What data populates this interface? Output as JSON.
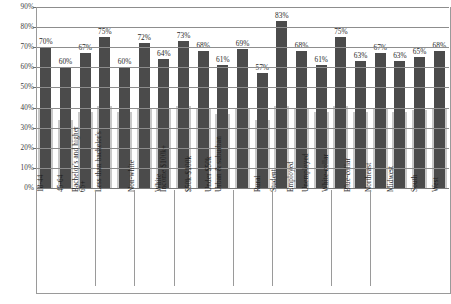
{
  "chart_data": {
    "type": "bar",
    "title": "",
    "xlabel": "",
    "ylabel": "",
    "ylim": [
      0,
      90
    ],
    "grid": true,
    "legend": "none",
    "ytick_labels": [
      "90%",
      "80%",
      "70%",
      "60%",
      "50%",
      "40%",
      "30%",
      "20%",
      "10%",
      "0%"
    ],
    "ytick_values": [
      90,
      80,
      70,
      60,
      50,
      40,
      30,
      20,
      10,
      0
    ],
    "categories": [
      "18-44",
      "45-64",
      "65+",
      "Bachelor's and higher",
      "Less than bachelor's",
      "Non-white",
      "White",
      "Income $100k+",
      "$50k-$100k",
      "Under $50k",
      "Urban & suburban",
      "Rural",
      "Student",
      "Employed",
      "Unemployed",
      "White-collar",
      "Blue-collar",
      "Northeast",
      "Midwest",
      "South",
      "West"
    ],
    "series": [
      {
        "name": "primary",
        "color": "#4b4b4b",
        "labelled": true,
        "values": [
          70,
          60,
          67,
          75,
          60,
          72,
          64,
          73,
          68,
          61,
          69,
          57,
          83,
          68,
          61,
          75,
          63,
          67,
          63,
          65,
          68
        ],
        "value_labels": [
          "70%",
          "60%",
          "67%",
          "75%",
          "60%",
          "72%",
          "64%",
          "73%",
          "68%",
          "61%",
          "69%",
          "57%",
          "83%",
          "68%",
          "61%",
          "75%",
          "63%",
          "67%",
          "63%",
          "65%",
          "68%"
        ]
      },
      {
        "name": "secondary",
        "color": "#c9c9c9",
        "labelled": false,
        "values": [
          40,
          34,
          38,
          41,
          38,
          40,
          40,
          41,
          40,
          37,
          40,
          34,
          41,
          40,
          38,
          41,
          38,
          40,
          38,
          39,
          40
        ]
      }
    ],
    "group_dividers_after": [
      2,
      4,
      6,
      9,
      11,
      14,
      16
    ]
  }
}
